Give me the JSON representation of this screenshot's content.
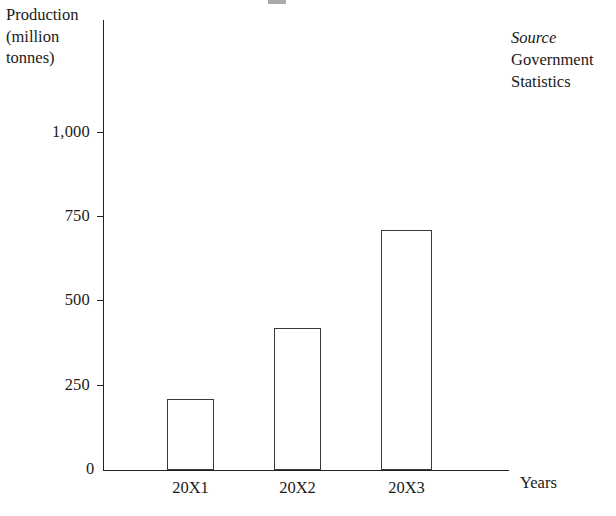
{
  "chart_data": {
    "type": "bar",
    "title": "",
    "subtitle": "",
    "categories": [
      "20X1",
      "20X2",
      "20X3"
    ],
    "values": [
      210,
      420,
      710
    ],
    "series": [
      {
        "name": "Production",
        "values": [
          210,
          420,
          710
        ]
      }
    ],
    "xlabel": "Years",
    "ylabel": "Production (million tonnes)",
    "ylim": [
      0,
      1125
    ],
    "ytick_values": [
      250,
      500,
      750,
      1000
    ],
    "ytick_labels": [
      "250",
      "500",
      "750",
      "1,000"
    ],
    "origin_label": "0",
    "grid": false,
    "legend": false,
    "legend_position": "none",
    "annotations": [
      "Source",
      "Government",
      "Statistics"
    ],
    "bar_fill_color": "#ffffff",
    "bar_edge_color": "#3a3a3a",
    "axis_color": "#222222",
    "background_color": "#ffffff"
  },
  "axes": {
    "y_title_lines": [
      "Production",
      "(million",
      "tonnes)"
    ],
    "x_title": "Years",
    "origin": "0",
    "y_ticks": [
      {
        "label": "1,000",
        "value": 1000
      },
      {
        "label": "750",
        "value": 750
      },
      {
        "label": "500",
        "value": 500
      },
      {
        "label": "250",
        "value": 250
      }
    ]
  },
  "source": {
    "heading": "Source",
    "lines": [
      "Government",
      "Statistics"
    ]
  },
  "bars": [
    {
      "category": "20X1",
      "value": 210
    },
    {
      "category": "20X2",
      "value": 420
    },
    {
      "category": "20X3",
      "value": 710
    }
  ]
}
